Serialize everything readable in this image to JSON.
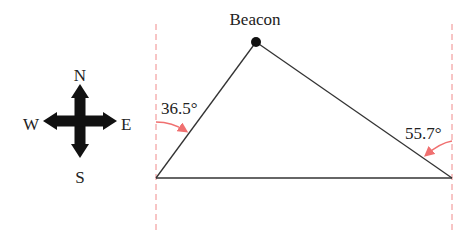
{
  "diagram": {
    "beacon_label": "Beacon",
    "left_angle": "36.5°",
    "right_angle": "55.7°",
    "compass": {
      "north": "N",
      "south": "S",
      "east": "E",
      "west": "W"
    },
    "colors": {
      "line": "#333333",
      "dashed": "#f08a8a",
      "arrow": "#f07070",
      "point": "#111111"
    }
  }
}
